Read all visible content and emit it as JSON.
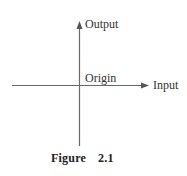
{
  "diagram": {
    "type": "coordinate-axes",
    "axes": {
      "vertical": {
        "label": "Output",
        "direction": "up"
      },
      "horizontal": {
        "label": "Input",
        "direction": "right"
      }
    },
    "origin_label": "Origin",
    "caption": {
      "word": "Figure",
      "number": "2.1"
    },
    "colors": {
      "line": "#6a6a6a",
      "text": "#333333",
      "background": "#ffffff"
    }
  }
}
